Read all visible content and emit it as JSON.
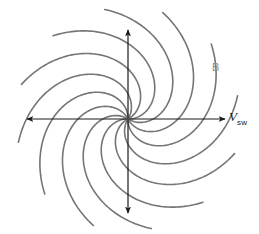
{
  "figure": {
    "kind": "parker-spiral-diagram",
    "background_color": "#ffffff",
    "width": 259,
    "height": 234
  },
  "labels": {
    "velocity_symbol": "V",
    "velocity_subscript": "sw",
    "magnetic_field": "B"
  },
  "chart_data": {
    "type": "line",
    "title": "",
    "xlabel": "",
    "ylabel": "",
    "grid": false,
    "legend": "none",
    "center": {
      "x": 128,
      "y": 119
    },
    "spiral": {
      "arm_count": 12,
      "angle_step_deg": 30,
      "start_angles_deg": [
        0,
        30,
        60,
        90,
        120,
        150,
        180,
        210,
        240,
        270,
        300,
        330
      ],
      "winding": "counterclockwise-outward",
      "r_min": 2,
      "r_max": 112,
      "total_sweep_deg": 132,
      "stroke_color": "#757575",
      "stroke_width": 1.6
    },
    "axes": {
      "stroke_color": "#1a1a1a",
      "stroke_width": 1.2,
      "arrow_heads": 4,
      "horizontal": {
        "x1": 27,
        "y1": 119,
        "x2": 225,
        "y2": 119
      },
      "vertical": {
        "x1": 128,
        "y1": 30,
        "x2": 128,
        "y2": 213
      },
      "x_range": [
        -101,
        97
      ],
      "y_range": [
        -94,
        89
      ]
    },
    "annotations": [
      {
        "text": "V",
        "subscript": "sw",
        "x": 229,
        "y": 119,
        "color": "#1a1a1a",
        "anchor": "right-arrow"
      },
      {
        "text": "B",
        "x": 217,
        "y": 68,
        "color": "#8a8a8a",
        "anchor": "outer-spiral-arm"
      }
    ]
  }
}
